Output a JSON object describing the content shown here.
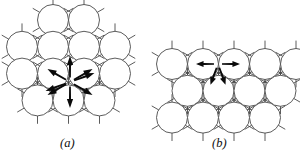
{
  "figure": {
    "type": "scientific-diagram",
    "background_color": "#ffffff",
    "line_color": "#4a4a4a",
    "arrow_color": "#0a0a0a",
    "circle_fill": "#ffffff",
    "line_width": 0.9
  },
  "panels": [
    {
      "id": "a",
      "label": "(a)",
      "label_x": 60,
      "label_y": 136,
      "lattice": {
        "arrangement": "hexagonal-close-packed",
        "circle_radius": 15.5,
        "row_spacing": 26.8,
        "col_spacing": 31,
        "origin_x": 22,
        "origin_y": 20,
        "rows": [
          {
            "count": 2,
            "offset_x": 31
          },
          {
            "count": 4,
            "offset_x": 0
          },
          {
            "count": 4,
            "offset_x": 0
          },
          {
            "count": 3,
            "offset_x": 15.5
          }
        ],
        "spike_length": 7.5
      },
      "arrows": {
        "count": 8,
        "center_x": 70,
        "center_y": 82,
        "inner_radius": 4.5,
        "outer_radius": 26,
        "directions_deg": [
          90,
          30,
          330,
          270,
          210,
          150,
          20,
          200
        ],
        "style": "solid-filled-barbed"
      }
    },
    {
      "id": "b",
      "label": "(b)",
      "label_x": 212,
      "label_y": 136,
      "lattice": {
        "arrangement": "hexagonal-close-packed",
        "circle_radius": 15.5,
        "row_spacing": 26.8,
        "col_spacing": 31,
        "origin_x": 172,
        "origin_y": 64,
        "rows": [
          {
            "count": 5,
            "offset_x": 0
          },
          {
            "count": 4,
            "offset_x": 15.5
          },
          {
            "count": 4,
            "offset_x": 0
          }
        ],
        "spike_length": 7.5
      },
      "arrows": {
        "count": 4,
        "center_x": 218,
        "center_y": 64,
        "inner_radius": 4.0,
        "outer_radius": 22,
        "directions_deg": [
          0,
          180,
          250,
          290
        ],
        "style": "solid-filled-barbed"
      }
    }
  ]
}
